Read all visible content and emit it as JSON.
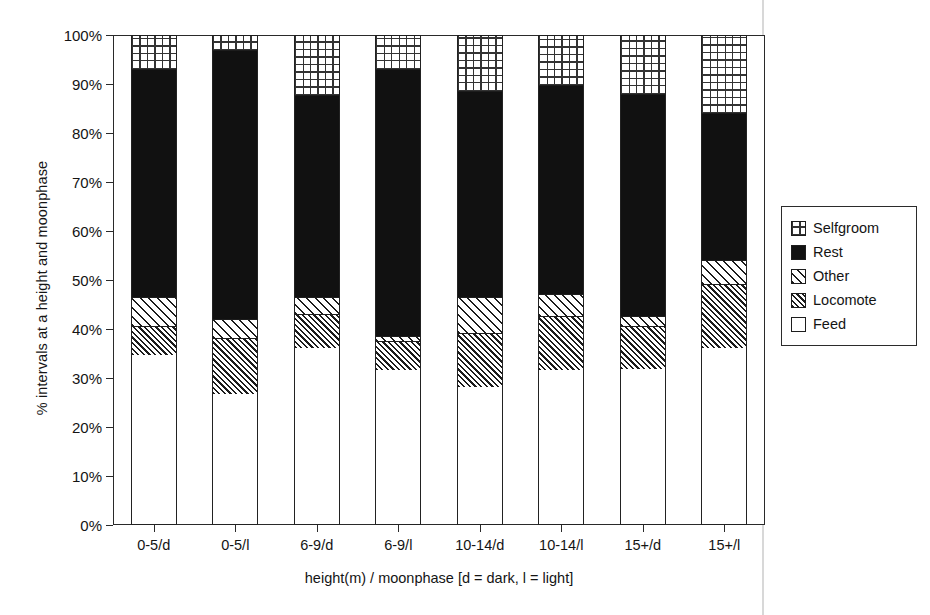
{
  "chart_data": {
    "type": "bar",
    "subtype": "stacked-percentage",
    "title": "",
    "xlabel": "height(m) / moonphase [d = dark, l = light]",
    "ylabel": "% intervals at a height and moonphase",
    "categories": [
      "0-5/d",
      "0-5/l",
      "6-9/d",
      "6-9/l",
      "10-14/d",
      "10-14/l",
      "15+/d",
      "15+/l"
    ],
    "series": [
      {
        "name": "Feed",
        "values": [
          34.5,
          26.5,
          36.0,
          31.5,
          28.0,
          31.5,
          31.8,
          36.0
        ]
      },
      {
        "name": "Locomote",
        "values": [
          6.0,
          11.5,
          7.0,
          6.0,
          11.0,
          11.0,
          8.7,
          13.0
        ]
      },
      {
        "name": "Other",
        "values": [
          6.0,
          4.0,
          3.5,
          1.0,
          7.5,
          4.5,
          2.0,
          5.0
        ]
      },
      {
        "name": "Rest",
        "values": [
          46.5,
          55.0,
          41.3,
          54.5,
          42.0,
          42.7,
          45.5,
          30.1
        ]
      },
      {
        "name": "Selfgroom",
        "values": [
          7.0,
          3.0,
          12.2,
          7.0,
          11.5,
          10.3,
          12.0,
          15.9
        ]
      }
    ],
    "cumulative_tops": [
      [
        34.5,
        40.5,
        46.5,
        93.0,
        100.0
      ],
      [
        26.5,
        38.0,
        42.0,
        97.0,
        100.0
      ],
      [
        36.0,
        43.0,
        46.5,
        87.8,
        100.0
      ],
      [
        31.5,
        37.5,
        38.5,
        93.0,
        100.0
      ],
      [
        28.0,
        39.0,
        46.5,
        88.5,
        100.0
      ],
      [
        31.5,
        42.5,
        47.0,
        89.7,
        100.0
      ],
      [
        31.8,
        40.5,
        42.5,
        88.0,
        100.0
      ],
      [
        36.0,
        49.0,
        54.0,
        84.1,
        100.0
      ]
    ],
    "ylim": [
      0,
      100
    ],
    "ytick_labels": [
      "0%",
      "10%",
      "20%",
      "30%",
      "40%",
      "50%",
      "60%",
      "70%",
      "80%",
      "90%",
      "100%"
    ],
    "ytick_values": [
      0,
      10,
      20,
      30,
      40,
      50,
      60,
      70,
      80,
      90,
      100
    ],
    "grid": false,
    "legend_position": "right",
    "legend_entries": [
      {
        "label": "Selfgroom",
        "pattern": "grid-crosshatch",
        "color": "#ffffff"
      },
      {
        "label": "Rest",
        "pattern": "solid",
        "color": "#111111"
      },
      {
        "label": "Other",
        "pattern": "diagonal-sparse",
        "color": "#ffffff"
      },
      {
        "label": "Locomote",
        "pattern": "diagonal-dense",
        "color": "#ffffff"
      },
      {
        "label": "Feed",
        "pattern": "empty",
        "color": "#ffffff"
      }
    ]
  }
}
